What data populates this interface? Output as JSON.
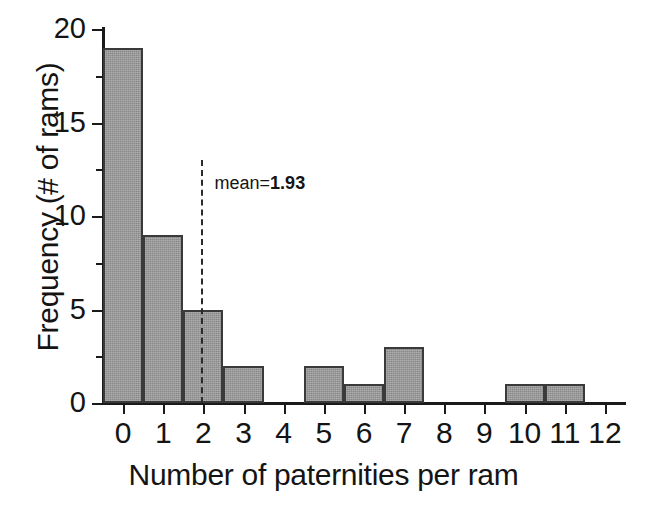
{
  "chart_data": {
    "type": "bar",
    "title": "",
    "xlabel": "Number of paternities per ram",
    "ylabel": "Frequency (# of rams)",
    "categories": [
      "0",
      "1",
      "2",
      "3",
      "4",
      "5",
      "6",
      "7",
      "8",
      "9",
      "10",
      "11",
      "12"
    ],
    "values": [
      19,
      9,
      5,
      2,
      0,
      2,
      1,
      3,
      0,
      0,
      1,
      1,
      0
    ],
    "xlim": [
      -0.5,
      12.5
    ],
    "ylim": [
      0,
      20
    ],
    "y_ticks": [
      0,
      5,
      10,
      15,
      20
    ],
    "y_minor_ticks": [
      2.5,
      7.5,
      12.5,
      17.5
    ],
    "x_ticks": [
      0,
      1,
      2,
      3,
      4,
      5,
      6,
      7,
      8,
      9,
      10,
      11,
      12
    ],
    "grid": false,
    "legend": "none",
    "bar_fill_color": "#9a9a9a",
    "bar_edge_color": "#3a3a3a",
    "axis_color": "#1a1a1a",
    "annotations": [
      {
        "name": "mean-line",
        "kind": "vline",
        "x": 1.93,
        "style": "dashed",
        "label_prefix": "mean=",
        "label_value": "1.93",
        "label_full": "mean=1.93"
      }
    ]
  }
}
